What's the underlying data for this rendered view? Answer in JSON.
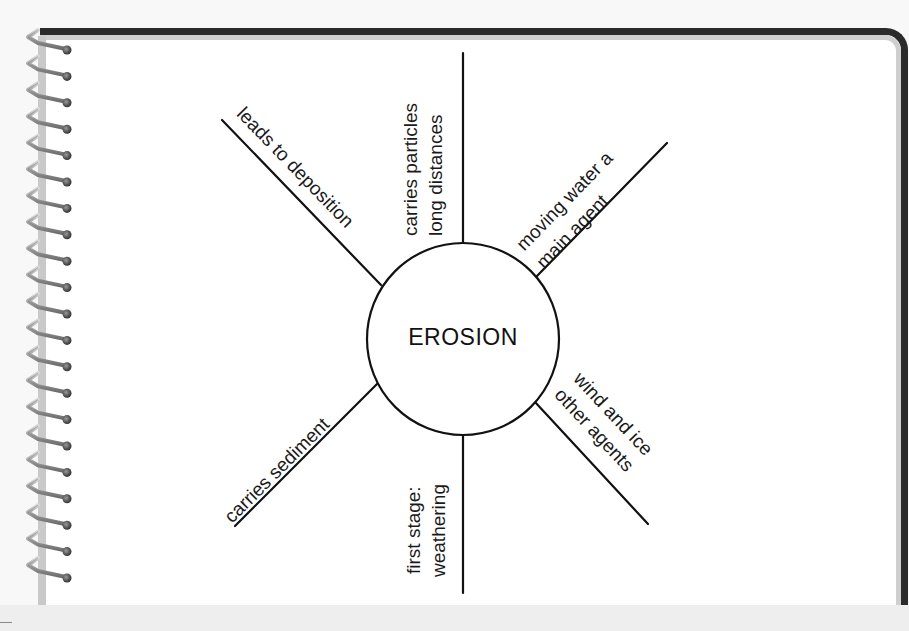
{
  "diagram": {
    "type": "spider-map",
    "center": {
      "label": "EROSION"
    },
    "spokes": [
      {
        "id": "top",
        "direction": "up",
        "lines": [
          "carries particles",
          "long distances"
        ]
      },
      {
        "id": "upper-right",
        "direction": "up-right",
        "lines": [
          "moving water a",
          "main agent"
        ]
      },
      {
        "id": "lower-right",
        "direction": "down-right",
        "lines": [
          "wind and ice",
          "other agents"
        ]
      },
      {
        "id": "bottom",
        "direction": "down",
        "lines": [
          "first stage:",
          "weathering"
        ]
      },
      {
        "id": "lower-left",
        "direction": "down-left",
        "lines": [
          "carries sediment"
        ]
      },
      {
        "id": "upper-left",
        "direction": "up-left",
        "lines": [
          "leads to deposition"
        ]
      }
    ]
  },
  "colors": {
    "ink": "#111111",
    "paper": "#ffffff",
    "border": "#2b2b2b",
    "border_shadow": "#cfcfcf",
    "background": "#f8f8f8"
  }
}
